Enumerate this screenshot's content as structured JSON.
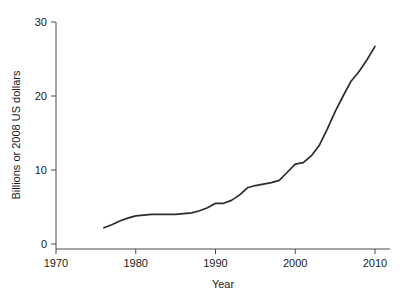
{
  "chart_data": {
    "type": "line",
    "title": "",
    "xlabel": "Year",
    "ylabel": "Billions or 2008 US dollars",
    "xlim": [
      1970,
      2010
    ],
    "ylim": [
      0,
      30
    ],
    "grid": false,
    "legend": "none",
    "xticks": [
      1970,
      1980,
      1990,
      2000,
      2010
    ],
    "xtick_labels": [
      "1970",
      "1980",
      "1990",
      "2000",
      "2010"
    ],
    "yticks": [
      0,
      10,
      20,
      30
    ],
    "ytick_labels": [
      "0",
      "10",
      "20",
      "30"
    ],
    "series": [
      {
        "name": "spending",
        "color": "#2b2b2b",
        "x": [
          1976,
          1977,
          1978,
          1979,
          1980,
          1981,
          1982,
          1983,
          1984,
          1985,
          1986,
          1987,
          1988,
          1989,
          1990,
          1991,
          1992,
          1993,
          1994,
          1995,
          1996,
          1997,
          1998,
          1999,
          2000,
          2001,
          2002,
          2003,
          2004,
          2005,
          2006,
          2007,
          2008,
          2009,
          2010
        ],
        "y": [
          2.2,
          2.6,
          3.1,
          3.5,
          3.8,
          3.9,
          4.0,
          4.0,
          4.0,
          4.0,
          4.1,
          4.2,
          4.5,
          4.9,
          5.5,
          5.5,
          5.9,
          6.6,
          7.6,
          7.9,
          8.1,
          8.3,
          8.6,
          9.7,
          10.8,
          11.0,
          11.9,
          13.3,
          15.5,
          17.9,
          20.0,
          22.0,
          23.3,
          24.9,
          26.7
        ]
      }
    ]
  }
}
